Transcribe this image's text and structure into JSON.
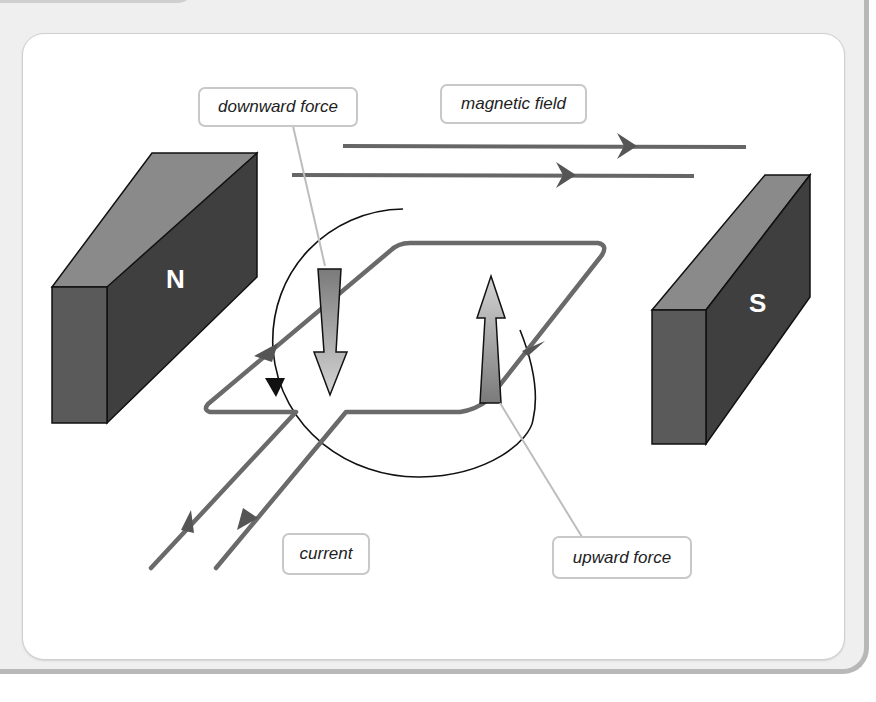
{
  "diagram": {
    "topic": "motor effect on a current-carrying coil in a magnetic field",
    "labels": {
      "downward_force": "downward force",
      "magnetic_field": "magnetic field",
      "current": "current",
      "upward_force": "upward force"
    },
    "magnets": {
      "north": "N",
      "south": "S"
    },
    "colors": {
      "magnet_front": "#5a5a5a",
      "magnet_face": "#3d3d3d",
      "magnet_top": "#8a8a8a",
      "wire": "#6a6a6a",
      "field_line": "#666666",
      "label_border": "#c8c8c8",
      "leader_line": "#bdbdbd",
      "panel_bg": "#efefef"
    }
  }
}
